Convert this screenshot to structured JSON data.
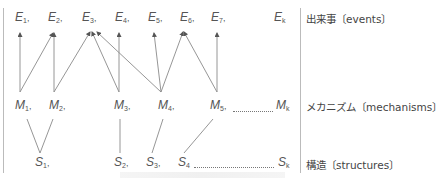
{
  "diagram": {
    "rows": {
      "events": {
        "label": "出来事〔events〕",
        "nodes": [
          {
            "id": "E1",
            "letter": "E",
            "sub": "1",
            "sep": ","
          },
          {
            "id": "E2",
            "letter": "E",
            "sub": "2",
            "sep": ","
          },
          {
            "id": "E3",
            "letter": "E",
            "sub": "3",
            "sep": ","
          },
          {
            "id": "E4",
            "letter": "E",
            "sub": "4",
            "sep": ","
          },
          {
            "id": "E5",
            "letter": "E",
            "sub": "5",
            "sep": ","
          },
          {
            "id": "E6",
            "letter": "E",
            "sub": "6",
            "sep": ","
          },
          {
            "id": "E7",
            "letter": "E",
            "sub": "7",
            "sep": ","
          },
          {
            "id": "Ek",
            "letter": "E",
            "sub": "k",
            "sep": ""
          }
        ]
      },
      "mechanisms": {
        "label": "メカニズム〔mechanisms〕",
        "nodes": [
          {
            "id": "M1",
            "letter": "M",
            "sub": "1",
            "sep": ","
          },
          {
            "id": "M2",
            "letter": "M",
            "sub": "2",
            "sep": ","
          },
          {
            "id": "M3",
            "letter": "M",
            "sub": "3",
            "sep": ","
          },
          {
            "id": "M4",
            "letter": "M",
            "sub": "4",
            "sep": ","
          },
          {
            "id": "M5",
            "letter": "M",
            "sub": "5",
            "sep": ","
          },
          {
            "id": "Mk",
            "letter": "M",
            "sub": "k",
            "sep": ""
          }
        ]
      },
      "structures": {
        "label": "構造〔structures〕",
        "nodes": [
          {
            "id": "S1",
            "letter": "S",
            "sub": "1",
            "sep": ","
          },
          {
            "id": "S2",
            "letter": "S",
            "sub": "2",
            "sep": ","
          },
          {
            "id": "S3",
            "letter": "S",
            "sub": "3",
            "sep": ","
          },
          {
            "id": "S4",
            "letter": "S",
            "sub": "4",
            "sep": ""
          },
          {
            "id": "Sk",
            "letter": "S",
            "sub": "k",
            "sep": ""
          }
        ]
      }
    },
    "edges_mechanism_to_event": [
      [
        "M1",
        "E1"
      ],
      [
        "M1",
        "E2"
      ],
      [
        "M2",
        "E2"
      ],
      [
        "M2",
        "E3"
      ],
      [
        "M3",
        "E3"
      ],
      [
        "M3",
        "E4"
      ],
      [
        "M4",
        "E3"
      ],
      [
        "M4",
        "E5"
      ],
      [
        "M4",
        "E6"
      ],
      [
        "M5",
        "E6"
      ],
      [
        "M5",
        "E7"
      ]
    ],
    "edges_structure_to_mechanism": [
      [
        "S1",
        "M1"
      ],
      [
        "S1",
        "M2"
      ],
      [
        "S2",
        "M3"
      ],
      [
        "S3",
        "M4"
      ],
      [
        "S4",
        "M5"
      ]
    ],
    "colors": {
      "line": "#8a8a8a",
      "text": "#555555",
      "divider": "#bbbbbb"
    }
  }
}
